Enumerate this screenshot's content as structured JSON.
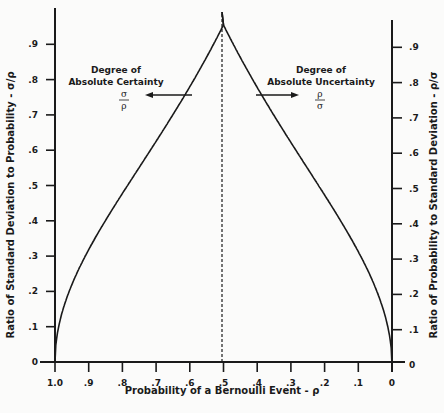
{
  "chart_data": {
    "type": "line",
    "title": "",
    "xlabel": "Probability of a Bernoulli Event - ρ",
    "ylabel_left": "Ratio of Standard Deviation to Probability - σ/ρ",
    "ylabel_right": "Ratio of Probability to Standard Deviation - ρ/σ",
    "x_ticks": [
      "1.0",
      ".9",
      ".8",
      ".7",
      ".6",
      ".5",
      ".4",
      ".3",
      ".2",
      ".1",
      "0"
    ],
    "x_tick_values": [
      1.0,
      0.9,
      0.8,
      0.7,
      0.6,
      0.5,
      0.4,
      0.3,
      0.2,
      0.1,
      0.0
    ],
    "y_ticks_left": [
      "0",
      ".1",
      ".2",
      ".3",
      ".4",
      ".5",
      ".6",
      ".7",
      ".8",
      ".9"
    ],
    "y_ticks_right": [
      "0",
      ".1",
      ".2",
      ".3",
      ".4",
      ".5",
      ".6",
      ".7",
      ".8",
      ".9"
    ],
    "xlim": [
      1.0,
      0.0
    ],
    "ylim": [
      0,
      1.0
    ],
    "grid": false,
    "legend": null,
    "series": [
      {
        "name": "Degree of Absolute Certainty σ/ρ",
        "x": [
          1.0,
          0.95,
          0.9,
          0.85,
          0.8,
          0.75,
          0.7,
          0.65,
          0.6,
          0.55,
          0.5
        ],
        "values": [
          0.0,
          0.23,
          0.33,
          0.42,
          0.5,
          0.58,
          0.65,
          0.73,
          0.82,
          0.9,
          1.0
        ]
      },
      {
        "name": "Degree of Absolute Uncertainty ρ/σ",
        "x": [
          0.5,
          0.45,
          0.4,
          0.35,
          0.3,
          0.25,
          0.2,
          0.15,
          0.1,
          0.05,
          0.0
        ],
        "values": [
          1.0,
          0.9,
          0.82,
          0.73,
          0.65,
          0.58,
          0.5,
          0.42,
          0.33,
          0.23,
          0.0
        ]
      }
    ],
    "annotations": [
      {
        "text_line1": "Degree of",
        "text_line2": "Absolute Certainty",
        "num": "σ",
        "den": "ρ",
        "arrow": "left"
      },
      {
        "text_line1": "Degree of",
        "text_line2": "Absolute Uncertainty",
        "num": "ρ",
        "den": "σ",
        "arrow": "right"
      },
      {
        "text": "dashed vertical line at ρ = .5"
      }
    ]
  }
}
